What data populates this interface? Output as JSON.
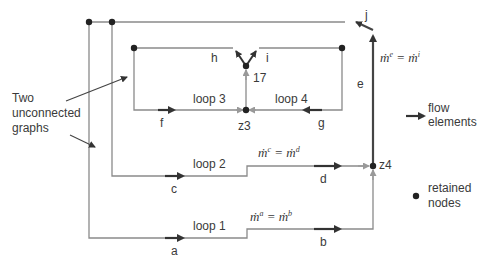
{
  "annotation": {
    "line1": "Two",
    "line2": "unconnected",
    "line3": "graphs"
  },
  "loops": {
    "loop1": "loop 1",
    "loop2": "loop 2",
    "loop3": "loop 3",
    "loop4": "loop 4"
  },
  "elements": {
    "a": "a",
    "b": "b",
    "c": "c",
    "d": "d",
    "e": "e",
    "f": "f",
    "g": "g",
    "h": "h",
    "i": "i",
    "j": "j"
  },
  "nodes": {
    "z3": "z3",
    "z4": "z4",
    "n17": "17"
  },
  "equations": {
    "eq1": {
      "lhs": "ṁ",
      "lhs_sup": "a",
      "rhs": "ṁ",
      "rhs_sup": "b"
    },
    "eq2": {
      "lhs": "ṁ",
      "lhs_sup": "c",
      "rhs": "ṁ",
      "rhs_sup": "d"
    },
    "eq3": {
      "lhs": "ṁ",
      "lhs_sup": "e",
      "rhs": "ṁ",
      "rhs_sup": "i"
    }
  },
  "legend": {
    "flow_line1": "flow",
    "flow_line2": "elements",
    "node_line1": "retained",
    "node_line2": "nodes"
  },
  "colors": {
    "line": "#8a8a8a",
    "arrow": "#333333",
    "node": "#222222"
  }
}
